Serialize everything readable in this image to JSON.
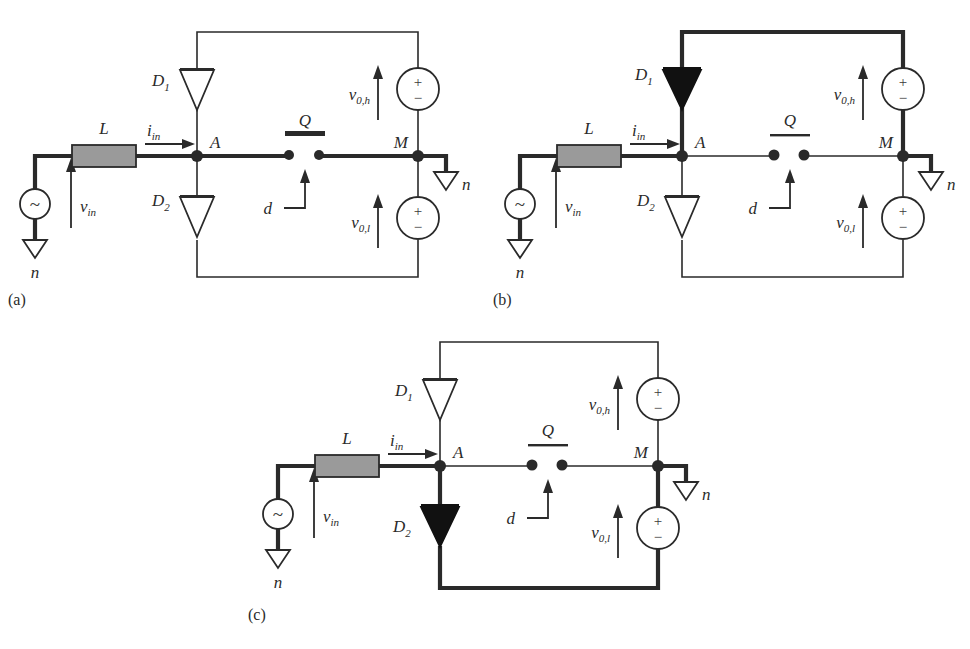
{
  "figure": {
    "type": "circuit-schematic",
    "background_color": "#ffffff",
    "line_color": "#2a2a2a",
    "bold_line_color": "#2a2a2a",
    "inductor_fill": "#9a9a9a",
    "diode_active_fill": "#111111",
    "diode_idle_fill": "#ffffff"
  },
  "labels": {
    "inductor": "L",
    "current_in": "i",
    "current_in_sub": "in",
    "voltage_in": "v",
    "voltage_in_sub": "in",
    "node_a": "A",
    "node_m": "M",
    "diode1": "D",
    "diode1_sub": "1",
    "diode2": "D",
    "diode2_sub": "2",
    "switch": "Q",
    "duty": "d",
    "ground": "n",
    "v_out_high": "v",
    "v_out_high_sub": "0,h",
    "v_out_low": "v",
    "v_out_low_sub": "0,l",
    "source_symbol": "~",
    "plus": "+",
    "minus": "−"
  },
  "panels": [
    {
      "id": "a",
      "caption": "(a)",
      "diode1_state": "off",
      "diode2_state": "off",
      "switch_state": "closed",
      "bold_path": "source-inductor-A-switch-M-ground",
      "top_loop": "thin",
      "bottom_loop": "thin"
    },
    {
      "id": "b",
      "caption": "(b)",
      "diode1_state": "on",
      "diode2_state": "off",
      "switch_state": "open",
      "bold_path": "source-inductor-A-D1-top-vOh-M-ground",
      "top_loop": "bold",
      "bottom_loop": "thin"
    },
    {
      "id": "c",
      "caption": "(c)",
      "diode1_state": "off",
      "diode2_state": "on",
      "switch_state": "open",
      "bold_path": "source-inductor-A-D2-bottom-vOl-M-ground",
      "top_loop": "thin",
      "bottom_loop": "bold"
    }
  ]
}
